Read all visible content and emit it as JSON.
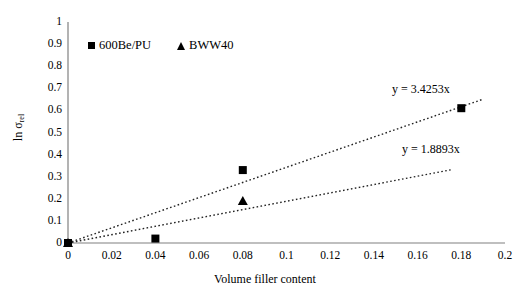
{
  "chart_data": {
    "type": "scatter",
    "title": "",
    "xlabel": "Volume filler content",
    "ylabel": "ln σrel",
    "ylabel_base": "ln σ",
    "ylabel_sub": "rel",
    "xlim": [
      0,
      0.2
    ],
    "ylim": [
      0,
      1
    ],
    "grid": false,
    "legend_position": "top-left",
    "x_ticks": [
      "0",
      "0.02",
      "0.04",
      "0.06",
      "0.08",
      "0.1",
      "0.12",
      "0.14",
      "0.16",
      "0.18",
      "0.2"
    ],
    "x_tick_values": [
      0,
      0.02,
      0.04,
      0.06,
      0.08,
      0.1,
      0.12,
      0.14,
      0.16,
      0.18,
      0.2
    ],
    "y_ticks": [
      "0",
      "0.1",
      "0.2",
      "0.3",
      "0.4",
      "0.5",
      "0.6",
      "0.7",
      "0.8",
      "0.9",
      "1"
    ],
    "y_tick_values": [
      0,
      0.1,
      0.2,
      0.3,
      0.4,
      0.5,
      0.6,
      0.7,
      0.8,
      0.9,
      1
    ],
    "series": [
      {
        "name": "600Be/PU",
        "marker": "square",
        "color": "#000000",
        "x": [
          0,
          0.04,
          0.08,
          0.18
        ],
        "y": [
          0,
          0.02,
          0.33,
          0.61
        ],
        "trendline": {
          "equation": "y = 3.4253x",
          "slope": 3.4253,
          "intercept": 0,
          "style": "dotted",
          "x_start": 0,
          "x_end": 0.19
        }
      },
      {
        "name": "BWW40",
        "marker": "triangle",
        "color": "#000000",
        "x": [
          0,
          0.08
        ],
        "y": [
          0,
          0.19
        ],
        "trendline": {
          "equation": "y = 1.8893x",
          "slope": 1.8893,
          "intercept": 0,
          "style": "dotted",
          "x_start": 0,
          "x_end": 0.176
        }
      }
    ],
    "annotations": [
      {
        "text": "y = 3.4253x",
        "x": 0.15,
        "y": 0.69
      },
      {
        "text": "y = 1.8893x",
        "x": 0.152,
        "y": 0.425
      }
    ]
  },
  "legend": {
    "items": [
      {
        "label": "600Be/PU",
        "marker": "square"
      },
      {
        "label": "BWW40",
        "marker": "triangle"
      }
    ]
  },
  "axes": {
    "x_title": "Volume filler content",
    "y_title": "ln σrel"
  }
}
